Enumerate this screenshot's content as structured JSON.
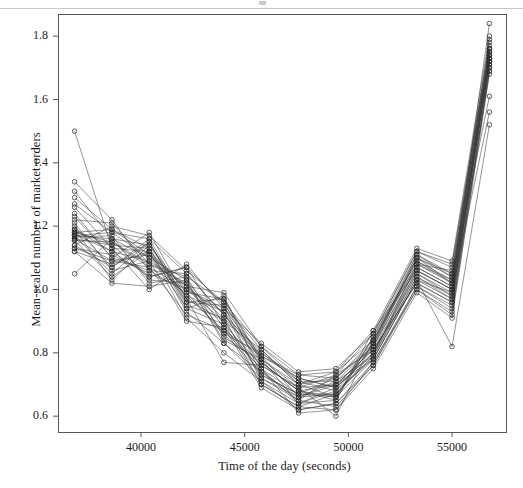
{
  "figure": {
    "background": "#ffffff",
    "width": 523,
    "height": 488
  },
  "axes": {
    "line_color": "#555555",
    "frame": {
      "left": 58,
      "right": 506,
      "top": 14,
      "bottom": 432
    }
  },
  "chart_data": {
    "type": "line",
    "title": "",
    "subtitle": "",
    "xlabel": "Time of the day (seconds)",
    "ylabel": "Mean-scaled number of market orders",
    "xlim": [
      36000,
      57600
    ],
    "ylim": [
      0.55,
      1.87
    ],
    "xticks": [
      40000,
      45000,
      50000,
      55000
    ],
    "xticklabels": [
      "40000",
      "45000",
      "50000",
      "55000"
    ],
    "yticks": [
      0.6,
      0.8,
      1.0,
      1.2,
      1.4,
      1.6,
      1.8
    ],
    "yticklabels": [
      "0.6",
      "0.8",
      "1.0",
      "1.2",
      "1.4",
      "1.6",
      "1.8"
    ],
    "grid": false,
    "legend": false,
    "legend_position": "none",
    "marker": "open-circle",
    "marker_size": 4.6,
    "line_color": "#3a3a3a",
    "line_width": 0.55,
    "x": [
      36800,
      38600,
      40400,
      42200,
      44000,
      45800,
      47600,
      49400,
      51200,
      53300,
      55000,
      56800
    ],
    "series": [
      {
        "name": "day-01",
        "values": [
          1.5,
          1.13,
          1.12,
          1.0,
          0.94,
          0.79,
          0.66,
          0.67,
          0.79,
          1.08,
          1.03,
          1.74
        ]
      },
      {
        "name": "day-02",
        "values": [
          1.34,
          1.22,
          1.06,
          1.05,
          0.92,
          0.77,
          0.68,
          0.7,
          0.81,
          1.06,
          1.0,
          1.72
        ]
      },
      {
        "name": "day-03",
        "values": [
          1.31,
          1.16,
          1.14,
          0.99,
          0.97,
          0.78,
          0.7,
          0.66,
          0.83,
          1.1,
          1.05,
          1.76
        ]
      },
      {
        "name": "day-04",
        "values": [
          1.27,
          1.18,
          1.1,
          1.03,
          0.88,
          0.75,
          0.64,
          0.68,
          0.78,
          1.03,
          0.97,
          1.73
        ]
      },
      {
        "name": "day-05",
        "values": [
          1.24,
          1.1,
          1.18,
          0.97,
          0.9,
          0.73,
          0.67,
          0.72,
          0.84,
          1.09,
          1.02,
          1.71
        ]
      },
      {
        "name": "day-06",
        "values": [
          1.22,
          1.21,
          1.08,
          1.02,
          0.86,
          0.8,
          0.72,
          0.69,
          0.8,
          1.05,
          0.99,
          1.75
        ]
      },
      {
        "name": "day-07",
        "values": [
          1.2,
          1.07,
          1.16,
          0.96,
          0.95,
          0.71,
          0.62,
          0.64,
          0.77,
          1.01,
          0.95,
          1.69
        ]
      },
      {
        "name": "day-08",
        "values": [
          1.185,
          1.14,
          1.04,
          1.07,
          0.89,
          0.76,
          0.69,
          0.73,
          0.86,
          1.12,
          1.07,
          1.78
        ]
      },
      {
        "name": "day-09",
        "values": [
          1.18,
          1.19,
          1.13,
          0.93,
          0.83,
          0.74,
          0.65,
          0.63,
          0.76,
          1.0,
          0.93,
          1.7
        ]
      },
      {
        "name": "day-10",
        "values": [
          1.175,
          1.12,
          1.09,
          1.01,
          0.99,
          0.82,
          0.71,
          0.71,
          0.82,
          1.07,
          1.01,
          1.84
        ]
      },
      {
        "name": "day-11",
        "values": [
          1.17,
          1.05,
          1.15,
          0.95,
          0.91,
          0.7,
          0.63,
          0.67,
          0.79,
          1.04,
          0.98,
          1.73
        ]
      },
      {
        "name": "day-12",
        "values": [
          1.165,
          1.17,
          1.02,
          1.04,
          0.85,
          0.77,
          0.68,
          0.65,
          0.85,
          1.11,
          1.04,
          1.74
        ]
      },
      {
        "name": "day-13",
        "values": [
          1.16,
          1.09,
          1.11,
          0.98,
          0.93,
          0.72,
          0.66,
          0.7,
          0.81,
          1.02,
          0.96,
          1.72
        ]
      },
      {
        "name": "day-14",
        "values": [
          1.155,
          1.15,
          1.07,
          0.92,
          0.87,
          0.79,
          0.73,
          0.74,
          0.87,
          1.13,
          1.09,
          1.8
        ]
      },
      {
        "name": "day-15",
        "values": [
          1.14,
          1.2,
          1.17,
          1.06,
          0.96,
          0.75,
          0.61,
          0.62,
          0.75,
          0.99,
          0.91,
          1.68
        ]
      },
      {
        "name": "day-16",
        "values": [
          1.13,
          1.11,
          1.05,
          1.0,
          0.9,
          0.81,
          0.7,
          0.72,
          0.83,
          1.08,
          1.06,
          1.76
        ]
      },
      {
        "name": "day-17",
        "values": [
          1.12,
          1.08,
          1.12,
          0.94,
          0.98,
          0.73,
          0.67,
          0.66,
          0.78,
          1.03,
          0.99,
          1.73
        ]
      },
      {
        "name": "day-18",
        "values": [
          1.05,
          1.16,
          1.03,
          1.02,
          0.84,
          0.78,
          0.64,
          0.69,
          0.8,
          1.06,
          1.0,
          1.71
        ]
      },
      {
        "name": "day-19",
        "values": [
          1.19,
          1.03,
          1.14,
          0.97,
          0.77,
          0.76,
          0.69,
          0.6,
          0.84,
          1.1,
          1.02,
          1.75
        ]
      },
      {
        "name": "day-20",
        "values": [
          1.26,
          1.13,
          1.0,
          1.08,
          0.94,
          0.83,
          0.74,
          0.75,
          0.86,
          1.12,
          1.08,
          1.77
        ]
      },
      {
        "name": "day-21",
        "values": [
          1.21,
          1.06,
          1.09,
          0.9,
          0.88,
          0.69,
          0.62,
          0.64,
          0.76,
          1.01,
          0.94,
          1.7
        ]
      },
      {
        "name": "day-22",
        "values": [
          1.17,
          1.18,
          1.16,
          1.05,
          0.92,
          0.8,
          0.71,
          0.68,
          0.82,
          1.07,
          1.01,
          1.74
        ]
      },
      {
        "name": "day-23",
        "values": [
          1.23,
          1.1,
          1.06,
          0.99,
          0.86,
          0.74,
          0.66,
          0.71,
          0.79,
          1.04,
          0.97,
          1.72
        ]
      },
      {
        "name": "day-24",
        "values": [
          1.16,
          1.14,
          1.13,
          0.96,
          0.97,
          0.77,
          0.68,
          0.66,
          0.85,
          1.09,
          1.03,
          1.79
        ]
      },
      {
        "name": "day-25",
        "values": [
          1.12,
          1.02,
          1.01,
          1.03,
          0.83,
          0.72,
          0.65,
          0.73,
          0.81,
          1.02,
          0.96,
          1.73
        ]
      },
      {
        "name": "day-26",
        "values": [
          1.29,
          1.19,
          1.11,
          1.01,
          0.91,
          0.79,
          0.72,
          0.69,
          0.83,
          1.11,
          1.05,
          1.76
        ]
      },
      {
        "name": "day-27",
        "values": [
          1.14,
          1.07,
          1.15,
          0.94,
          0.89,
          0.7,
          0.63,
          0.62,
          0.77,
          1.0,
          0.92,
          1.69
        ]
      },
      {
        "name": "day-28",
        "values": [
          1.19,
          1.12,
          1.04,
          1.07,
          0.95,
          0.81,
          0.7,
          0.74,
          0.84,
          1.08,
          1.02,
          1.75
        ]
      },
      {
        "name": "day-29",
        "values": [
          1.17,
          1.16,
          1.1,
          0.98,
          0.87,
          0.75,
          0.67,
          0.67,
          0.8,
          1.05,
          0.98,
          1.72
        ]
      },
      {
        "name": "day-30",
        "values": [
          1.13,
          1.09,
          1.07,
          1.0,
          0.93,
          0.78,
          0.69,
          0.7,
          0.78,
          1.03,
          0.82,
          1.52
        ]
      },
      {
        "name": "day-31",
        "values": [
          1.155,
          1.04,
          1.12,
          0.91,
          0.8,
          0.71,
          0.64,
          0.65,
          0.87,
          1.06,
          1.0,
          1.56
        ]
      },
      {
        "name": "day-32",
        "values": [
          1.18,
          1.15,
          1.08,
          1.04,
          0.96,
          0.82,
          0.73,
          0.72,
          0.82,
          1.1,
          1.04,
          1.61
        ]
      }
    ]
  }
}
